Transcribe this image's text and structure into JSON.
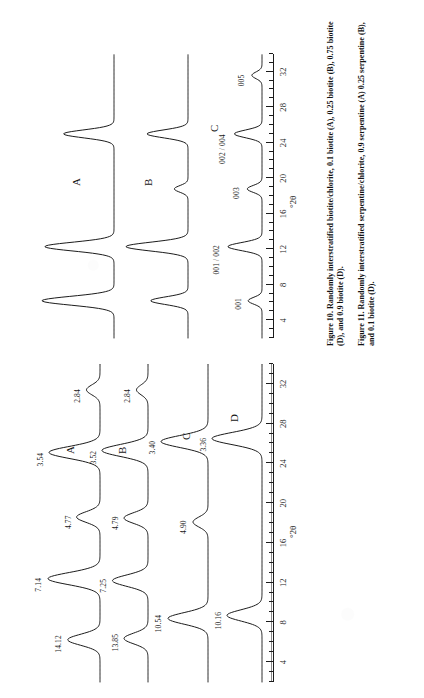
{
  "document": {
    "kind": "scanned-journal-page",
    "orientation": "rotated-90-ccw",
    "page_background": "#ffffff",
    "ink_color": "#1c1c1c"
  },
  "figure10": {
    "id": "figure-10",
    "caption_label": "Figure 10.",
    "caption_text": "Randomly interstratified biotite/chlorite, 0.1 biotite (A), 0.25 biotite (B), 0.75 biotite (D), and 0.9 biotite (D).",
    "axis": {
      "title": "°2θ",
      "tick_labels": [
        "4",
        "8",
        "12",
        "16",
        "20",
        "24",
        "28",
        "32"
      ],
      "tick_values": [
        4,
        8,
        12,
        16,
        20,
        24,
        28,
        32
      ],
      "range": [
        2,
        34
      ],
      "minor_step": 1
    },
    "traces": [
      {
        "name": "A",
        "label": "A"
      },
      {
        "name": "B",
        "label": "B"
      },
      {
        "name": "C",
        "label": "C"
      }
    ],
    "peak_labels": [
      {
        "text": "001",
        "two_theta": 6.2
      },
      {
        "text": "001 / 002",
        "two_theta": 12.3
      },
      {
        "text": "003",
        "two_theta": 18.8
      },
      {
        "text": "002 / 004",
        "two_theta": 25.0
      },
      {
        "text": "005",
        "two_theta": 31.6
      }
    ],
    "chart_data": {
      "type": "line",
      "title": "Randomly interstratified biotite/chlorite",
      "xlabel": "°2θ",
      "ylabel": "Intensity (arbitrary units)",
      "xlim": [
        2,
        34
      ],
      "grid": false,
      "legend": "inline-trace-letters",
      "x_ticks": [
        4,
        8,
        12,
        16,
        20,
        24,
        28,
        32
      ],
      "series": [
        {
          "name": "A",
          "peaks": [
            {
              "two_theta": 6.2,
              "relative_intensity": 100,
              "label": "001"
            },
            {
              "two_theta": 12.3,
              "relative_intensity": 96,
              "label": "001 / 002"
            },
            {
              "two_theta": 25.0,
              "relative_intensity": 70,
              "label": "002 / 004"
            }
          ]
        },
        {
          "name": "B",
          "peaks": [
            {
              "two_theta": 6.2,
              "relative_intensity": 60,
              "label": "001"
            },
            {
              "two_theta": 12.3,
              "relative_intensity": 100,
              "label": "001 / 002"
            },
            {
              "two_theta": 18.8,
              "relative_intensity": 22,
              "label": "003"
            },
            {
              "two_theta": 25.0,
              "relative_intensity": 66,
              "label": "002 / 004"
            }
          ]
        },
        {
          "name": "C",
          "peaks": [
            {
              "two_theta": 6.2,
              "relative_intensity": 30,
              "label": "001"
            },
            {
              "two_theta": 12.3,
              "relative_intensity": 74,
              "label": "001 / 002"
            },
            {
              "two_theta": 18.8,
              "relative_intensity": 32,
              "label": "003"
            },
            {
              "two_theta": 25.0,
              "relative_intensity": 60,
              "label": "002 / 004"
            },
            {
              "two_theta": 31.6,
              "relative_intensity": 22,
              "label": "005"
            }
          ]
        }
      ]
    }
  },
  "figure11": {
    "id": "figure-11",
    "caption_label": "Figure 11.",
    "caption_text": "Randomly interstratified serpentine/chlorite, 0.9 serpentine (A) 0.25 serpentine (B), and 0.1 biotite (D).",
    "axis": {
      "title": "°2θ",
      "tick_labels": [
        "4",
        "8",
        "12",
        "16",
        "20",
        "24",
        "28",
        "32"
      ],
      "tick_values": [
        4,
        8,
        12,
        16,
        20,
        24,
        28,
        32
      ],
      "range": [
        2,
        34
      ],
      "minor_step": 1
    },
    "traces": [
      {
        "name": "A",
        "label": "A"
      },
      {
        "name": "B",
        "label": "B"
      },
      {
        "name": "C",
        "label": "C"
      },
      {
        "name": "D",
        "label": "D"
      }
    ],
    "chart_data": {
      "type": "line",
      "title": "Randomly interstratified serpentine/chlorite",
      "xlabel": "°2θ",
      "ylabel": "Intensity (arbitrary units)",
      "xlim": [
        2,
        34
      ],
      "grid": false,
      "legend": "inline-trace-letters",
      "x_ticks": [
        4,
        8,
        12,
        16,
        20,
        24,
        28,
        32
      ],
      "series": [
        {
          "name": "A",
          "d_spacing_labels": [
            "14.12",
            "7.14",
            "4.77",
            "3.54",
            "2.84"
          ],
          "peaks": [
            {
              "d": "14.12",
              "two_theta": 6.25,
              "relative_intensity": 62
            },
            {
              "d": "7.14",
              "two_theta": 12.4,
              "relative_intensity": 100
            },
            {
              "d": "4.77",
              "two_theta": 18.6,
              "relative_intensity": 45
            },
            {
              "d": "3.54",
              "two_theta": 25.1,
              "relative_intensity": 98
            },
            {
              "d": "2.84",
              "two_theta": 31.4,
              "relative_intensity": 26
            }
          ]
        },
        {
          "name": "B",
          "d_spacing_labels": [
            "13.85",
            "7.25",
            "4.79",
            "3.52",
            "2.84"
          ],
          "peaks": [
            {
              "d": "13.85",
              "two_theta": 6.38,
              "relative_intensity": 50
            },
            {
              "d": "7.25",
              "two_theta": 12.2,
              "relative_intensity": 74
            },
            {
              "d": "4.79",
              "two_theta": 18.5,
              "relative_intensity": 50
            },
            {
              "d": "3.52",
              "two_theta": 25.3,
              "relative_intensity": 96
            },
            {
              "d": "2.84",
              "two_theta": 31.4,
              "relative_intensity": 24
            }
          ]
        },
        {
          "name": "C",
          "d_spacing_labels": [
            "10.54",
            "4.90",
            "3.40"
          ],
          "peaks": [
            {
              "d": "10.54",
              "two_theta": 8.4,
              "relative_intensity": 80
            },
            {
              "d": "4.90",
              "two_theta": 18.1,
              "relative_intensity": 30
            },
            {
              "d": "3.40",
              "two_theta": 26.2,
              "relative_intensity": 94
            }
          ]
        },
        {
          "name": "D",
          "d_spacing_labels": [
            "10.16",
            "3.36"
          ],
          "peaks": [
            {
              "d": "10.16",
              "two_theta": 8.7,
              "relative_intensity": 70
            },
            {
              "d": "3.36",
              "two_theta": 26.5,
              "relative_intensity": 100
            }
          ]
        }
      ]
    }
  }
}
